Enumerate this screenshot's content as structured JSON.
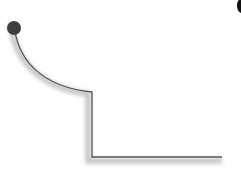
{
  "diagram": {
    "background": "#ffffff",
    "stroke_color": "#555555",
    "shadow_color": "#bdbdbd",
    "dot_color": "#3f3f3f",
    "edge_mark_color": "#111111",
    "outline": {
      "curve_start": [
        14,
        22
      ],
      "curve_end": [
        92,
        92
      ],
      "vertical_end": [
        92,
        157
      ],
      "horizontal_end": [
        222,
        157
      ]
    },
    "dot": {
      "cx": 14,
      "cy": 28,
      "r": 7
    },
    "edge_mark": {
      "x": 237,
      "y": 0
    }
  }
}
